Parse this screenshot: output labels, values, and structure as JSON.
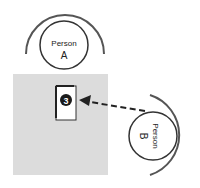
{
  "diagram": {
    "persons": [
      {
        "id": "A",
        "label_line1": "Person",
        "label_line2": "A"
      },
      {
        "id": "B",
        "label_line1": "Person",
        "label_line2": "B"
      }
    ],
    "marker": {
      "number": "3"
    },
    "arrow": {
      "from": "Person B",
      "to": "marker 3",
      "style": "dashed"
    },
    "colors": {
      "table": "#dcdcdc",
      "stroke": "#333333",
      "arc": "#555555",
      "marker_fill": "#1a1a1a",
      "marker_text": "#ffffff",
      "background": "#ffffff"
    }
  }
}
